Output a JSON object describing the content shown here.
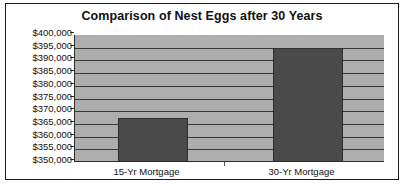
{
  "chart_data": {
    "type": "bar",
    "title": "Comparison of Nest Eggs after 30 Years",
    "xlabel": "",
    "ylabel": "",
    "categories": [
      "15-Yr Mortgage",
      "30-Yr Mortgage"
    ],
    "values": [
      367500,
      395000
    ],
    "value_labels": [
      "$367,500",
      "$395,000"
    ],
    "ylim": [
      350000,
      400000
    ],
    "ytick_values": [
      400000,
      395000,
      390000,
      385000,
      380000,
      375000,
      370000,
      365000,
      360000,
      355000,
      350000
    ],
    "ytick_labels": [
      "$400,000",
      "$395,000",
      "$390,000",
      "$385,000",
      "$380,000",
      "$375,000",
      "$370,000",
      "$365,000",
      "$360,000",
      "$355,000",
      "$350,000"
    ],
    "grid": true,
    "legend": false,
    "legend_position": "none",
    "colors": {
      "bar_fill": "#4a4a4a",
      "bar_edge": "#2e2e2e",
      "plot_background": "#adadad",
      "gridline": "#3a3a3a",
      "axis": "#2b2b2b",
      "frame_border": "#1a1a1a",
      "text": "#111111",
      "figure_background": "#ffffff"
    }
  }
}
